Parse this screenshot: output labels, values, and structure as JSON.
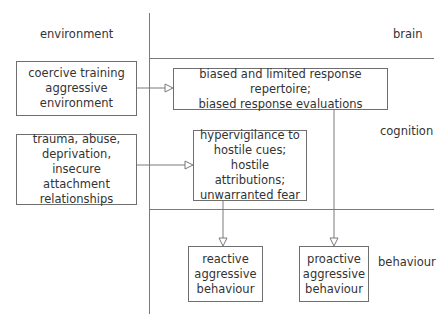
{
  "zones": {
    "environment": "environment",
    "brain": "brain",
    "cognition": "cognition",
    "behaviour": "behaviour"
  },
  "nodes": {
    "coercive": "coercive training\naggressive\nenvironment",
    "trauma": "trauma, abuse,\ndeprivation,\ninsecure attachment\nrelationships",
    "biased": "biased and limited response repertoire;\nbiased response evaluations",
    "hypervigilance": "hypervigilance to\nhostile cues;\nhostile attributions;\nunwarranted fear",
    "reactive": "reactive\naggressive\nbehaviour",
    "proactive": "proactive\naggressive\nbehaviour"
  },
  "edges": [
    {
      "from": "coercive",
      "to": "biased"
    },
    {
      "from": "trauma",
      "to": "hypervigilance"
    },
    {
      "from": "hypervigilance",
      "to": "reactive"
    },
    {
      "from": "biased",
      "to": "proactive"
    }
  ],
  "colors": {
    "line": "#7a7a7a",
    "text": "#333333",
    "background": "#ffffff"
  }
}
